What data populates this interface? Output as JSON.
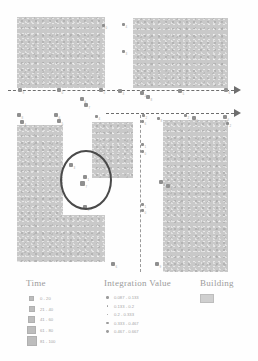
{
  "map": {
    "buildings": [
      {
        "name": "building-top-left",
        "x": 17,
        "y": 17,
        "w": 88,
        "h": 71
      },
      {
        "name": "building-top-right",
        "x": 133,
        "y": 18,
        "w": 95,
        "h": 70
      },
      {
        "name": "building-middle",
        "x": 92,
        "y": 122,
        "w": 41,
        "h": 56
      },
      {
        "name": "building-bottom-right",
        "x": 163,
        "y": 120,
        "w": 65,
        "h": 152
      }
    ],
    "lshape": [
      {
        "name": "building-bottom-left-arm-vertical",
        "x": 17,
        "y": 125,
        "w": 46,
        "h": 137
      },
      {
        "name": "building-bottom-left-arm-foot",
        "x": 17,
        "y": 215,
        "w": 88,
        "h": 47
      }
    ],
    "paths": [
      {
        "name": "dashed-path-upper",
        "x": 8,
        "y": 90,
        "w": 226
      },
      {
        "name": "dashed-path-lower",
        "x": 106,
        "y": 113,
        "w": 128
      }
    ],
    "arrows": [
      {
        "name": "path-arrow-upper",
        "x": 234,
        "y": 86
      },
      {
        "name": "path-arrow-lower",
        "x": 234,
        "y": 109
      }
    ],
    "vertical_path": {
      "name": "dashed-path-vertical",
      "x": 140,
      "y": 115,
      "h": 157
    },
    "highlight": {
      "name": "highlight-ellipse",
      "x": 60,
      "y": 150,
      "w": 48,
      "h": 56
    },
    "markers": [
      {
        "x": 102,
        "y": 24,
        "s": 3,
        "label": "0"
      },
      {
        "x": 122,
        "y": 23,
        "s": 3,
        "label": "4"
      },
      {
        "x": 122,
        "y": 50,
        "s": 3,
        "label": "3"
      },
      {
        "x": 18,
        "y": 88,
        "s": 4,
        "label": "9"
      },
      {
        "x": 57,
        "y": 88,
        "s": 4,
        "label": "0"
      },
      {
        "x": 99,
        "y": 88,
        "s": 4,
        "label": "0"
      },
      {
        "x": 80,
        "y": 97,
        "s": 4,
        "label": "6"
      },
      {
        "x": 84,
        "y": 103,
        "s": 4,
        "label": "7"
      },
      {
        "x": 118,
        "y": 89,
        "s": 4,
        "label": "3"
      },
      {
        "x": 140,
        "y": 91,
        "s": 4,
        "label": "2"
      },
      {
        "x": 146,
        "y": 95,
        "s": 4,
        "label": "8"
      },
      {
        "x": 178,
        "y": 89,
        "s": 4,
        "label": "5"
      },
      {
        "x": 224,
        "y": 88,
        "s": 4,
        "label": "6"
      },
      {
        "x": 17,
        "y": 113,
        "s": 4,
        "label": "8"
      },
      {
        "x": 20,
        "y": 120,
        "s": 4,
        "label": "4"
      },
      {
        "x": 54,
        "y": 113,
        "s": 4,
        "label": "6"
      },
      {
        "x": 57,
        "y": 119,
        "s": 4,
        "label": "5"
      },
      {
        "x": 95,
        "y": 115,
        "s": 3,
        "label": "4"
      },
      {
        "x": 142,
        "y": 114,
        "s": 3,
        "label": "2"
      },
      {
        "x": 141,
        "y": 120,
        "s": 3,
        "label": "6"
      },
      {
        "x": 157,
        "y": 117,
        "s": 3,
        "label": "8"
      },
      {
        "x": 184,
        "y": 114,
        "s": 3,
        "label": "2"
      },
      {
        "x": 192,
        "y": 116,
        "s": 4,
        "label": "5"
      },
      {
        "x": 223,
        "y": 115,
        "s": 4,
        "label": "6"
      },
      {
        "x": 226,
        "y": 122,
        "s": 3,
        "label": "2"
      },
      {
        "x": 141,
        "y": 143,
        "s": 3,
        "label": "1"
      },
      {
        "x": 141,
        "y": 150,
        "s": 3,
        "label": "0"
      },
      {
        "x": 159,
        "y": 180,
        "s": 4,
        "label": "4"
      },
      {
        "x": 166,
        "y": 184,
        "s": 4,
        "label": "1"
      },
      {
        "x": 141,
        "y": 203,
        "s": 3,
        "label": "1"
      },
      {
        "x": 141,
        "y": 209,
        "s": 3,
        "label": "0"
      },
      {
        "x": 69,
        "y": 163,
        "s": 4,
        "label": "3"
      },
      {
        "x": 83,
        "y": 175,
        "s": 4,
        "label": "1"
      },
      {
        "x": 80,
        "y": 181,
        "s": 5,
        "label": "7"
      },
      {
        "x": 83,
        "y": 205,
        "s": 4,
        "label": "5"
      },
      {
        "x": 111,
        "y": 262,
        "s": 4,
        "label": "6"
      },
      {
        "x": 155,
        "y": 262,
        "s": 4,
        "label": "9"
      }
    ]
  },
  "legend": {
    "time": {
      "title": "Time",
      "items": [
        {
          "label": "0 - 20",
          "size": 3
        },
        {
          "label": "21 - 40",
          "size": 4
        },
        {
          "label": "41 - 60",
          "size": 5
        },
        {
          "label": "61 - 80",
          "size": 6.5
        },
        {
          "label": "81 - 100",
          "size": 8
        }
      ]
    },
    "integration": {
      "title": "Integration Value",
      "items": [
        {
          "label": "0.087 - 0.133",
          "size": 2.4
        },
        {
          "label": "0.133 - 0.2",
          "size": 1.4
        },
        {
          "label": "0.2 - 0.333",
          "size": 1.8
        },
        {
          "label": "0.333 - 0.467",
          "size": 2.4
        },
        {
          "label": "0.467 - 0.667",
          "size": 2.8
        }
      ]
    },
    "building": {
      "title": "Building"
    }
  },
  "colors": {
    "building_fill": "#c9c9c9",
    "path_line": "#6e6e6e",
    "highlight": "#4a4a4a",
    "legend_text": "#a5a5a5"
  }
}
